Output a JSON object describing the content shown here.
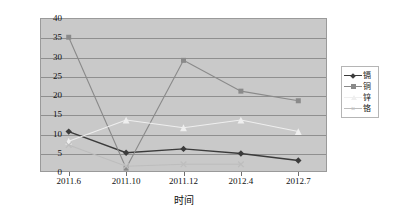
{
  "chart_data": {
    "type": "line",
    "title": "",
    "xlabel": "时间",
    "ylabel": "",
    "categories": [
      "2011.6",
      "2011.10",
      "2011.12",
      "2012.4",
      "2012.7"
    ],
    "ylim": [
      0,
      40
    ],
    "ytick_labels": [
      "0",
      "5",
      "10",
      "15",
      "20",
      "25",
      "30",
      "35",
      "40"
    ],
    "ytick_values": [
      0,
      5,
      10,
      15,
      20,
      25,
      30,
      35,
      40
    ],
    "grid": true,
    "legend_position": "right",
    "series": [
      {
        "name": "镉",
        "color": "#3b3b3b",
        "marker": "diamond",
        "values": [
          10.5,
          5.0,
          6.0,
          4.8,
          3.0
        ]
      },
      {
        "name": "铜",
        "color": "#8a8a8a",
        "marker": "square",
        "values": [
          35.0,
          1.0,
          29.0,
          21.0,
          18.5
        ]
      },
      {
        "name": "锌",
        "color": "#efefef",
        "marker": "triangle",
        "values": [
          8.0,
          13.5,
          11.5,
          13.5,
          10.5
        ]
      },
      {
        "name": "铬",
        "color": "#bdbdbd",
        "marker": "cross",
        "values": [
          7.0,
          1.5,
          2.0,
          2.0,
          null
        ]
      }
    ]
  },
  "legend": {
    "items": [
      {
        "label": "镉"
      },
      {
        "label": "铜"
      },
      {
        "label": "锌"
      },
      {
        "label": "铬"
      }
    ]
  }
}
